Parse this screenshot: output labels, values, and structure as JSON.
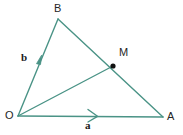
{
  "figure": {
    "type": "vector-triangle-diagram",
    "background_color": "#ffffff",
    "stroke_color": "#4a9386",
    "point_color": "#111111",
    "label_color": "#262626",
    "width": 183,
    "height": 135
  },
  "points": {
    "O": {
      "label": "O",
      "x": 18,
      "y": 116
    },
    "B": {
      "label": "B",
      "x": 58,
      "y": 19
    },
    "A": {
      "label": "A",
      "x": 163,
      "y": 117
    },
    "M": {
      "label": "M",
      "x": 113,
      "y": 66,
      "marker": "filled-dot"
    }
  },
  "segments": [
    {
      "name": "segment-OB",
      "from": "O",
      "to": "B",
      "arrow": true,
      "vector_label": "b"
    },
    {
      "name": "segment-OA",
      "from": "O",
      "to": "A",
      "arrow": true,
      "vector_label": "a"
    },
    {
      "name": "segment-BA",
      "from": "B",
      "to": "A",
      "arrow": false,
      "vector_label": ""
    },
    {
      "name": "segment-OM",
      "from": "O",
      "to": "M",
      "arrow": false,
      "vector_label": ""
    }
  ],
  "vectors": {
    "a": {
      "label": "a",
      "along": "segment-OA"
    },
    "b": {
      "label": "b",
      "along": "segment-OB"
    }
  }
}
